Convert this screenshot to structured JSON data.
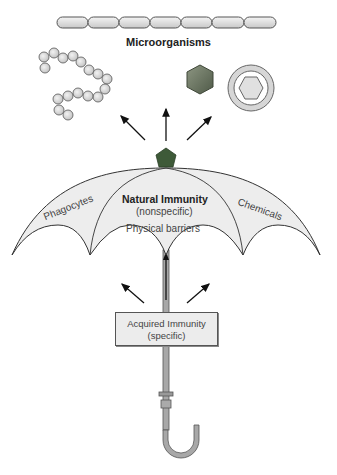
{
  "diagram": {
    "title": "Microorganisms",
    "organisms": [
      {
        "name": "bacilli-chain",
        "segments": 7
      },
      {
        "name": "cocci-chain",
        "beads": 18
      },
      {
        "name": "virus-hexagon"
      },
      {
        "name": "enveloped-virus"
      }
    ],
    "umbrella": {
      "center_label": "Natural Immunity",
      "center_sublabel": "(nonspecific)",
      "left_panel": "Phagocytes",
      "right_panel": "Chemicals",
      "lower_label": "Physical barriers"
    },
    "handle_box": {
      "line1": "Acquired Immunity",
      "line2": "(specific)"
    },
    "colors": {
      "canopy": "#ededed",
      "outline": "#444444",
      "pentagon": "#3e5a38",
      "hexagon": "#6b7560",
      "handle": "#a8a8a8"
    }
  }
}
